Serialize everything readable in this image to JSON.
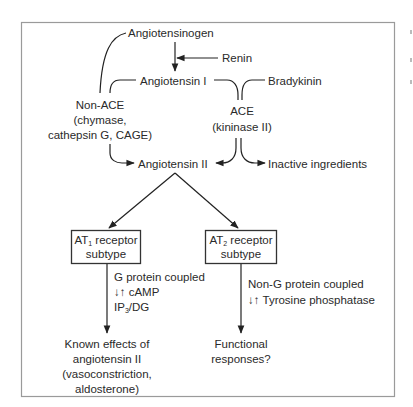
{
  "diagram": {
    "nodes": {
      "angiotensinogen": "Angiotensinogen",
      "renin": "Renin",
      "angiotensin_i": "Angiotensin I",
      "bradykinin": "Bradykinin",
      "non_ace": {
        "line1": "Non-ACE",
        "line2": "(chymase,",
        "line3": "cathepsin G, CAGE)"
      },
      "ace": {
        "line1": "ACE",
        "line2": "(kininase II)"
      },
      "angiotensin_ii": "Angiotensin II",
      "inactive": "Inactive ingredients",
      "at1": {
        "prefix": "AT",
        "subscript": "1",
        "suffix": " receptor",
        "line2": "subtype"
      },
      "at2": {
        "prefix": "AT",
        "subscript": "2",
        "suffix": " receptor",
        "line2": "subtype"
      },
      "at1_signal": {
        "line1": "G protein coupled",
        "line2": "↓↑ cAMP",
        "line3_prefix": "IP",
        "line3_sub": "3",
        "line3_suffix": "/DG"
      },
      "at2_signal": {
        "line1": "Non-G protein coupled",
        "line2": "↓↑ Tyrosine phosphatase"
      },
      "at1_effects": {
        "line1": "Known effects of",
        "line2": "angiotensin II",
        "line3": "(vasoconstriction,",
        "line4": "aldosterone)"
      },
      "at2_effects": {
        "line1": "Functional",
        "line2": "responses?"
      }
    },
    "colors": {
      "line": "#222222",
      "text": "#2a2a2a",
      "frame": "#9a9a9a",
      "background": "#ffffff"
    }
  }
}
